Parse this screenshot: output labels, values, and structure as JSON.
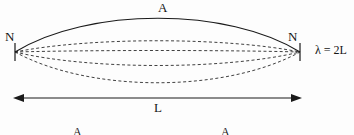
{
  "figure": {
    "width": 354,
    "height": 135,
    "background_color": "#fdfdfd",
    "ink_color": "#1a1a1a"
  },
  "labels": {
    "antinode_top": "A",
    "node_left": "N",
    "node_right": "N",
    "wavelength_relation": "λ = 2L",
    "length": "L",
    "antinode_bottom_left": "A",
    "antinode_bottom_right": "A"
  },
  "diagram_data": {
    "type": "standing-wave",
    "mode": "fundamental",
    "harmonic_number": 1,
    "node_count": 2,
    "antinode_count": 1,
    "endpoints": {
      "left": {
        "x": 15,
        "y": 52
      },
      "right": {
        "x": 300,
        "y": 52
      }
    },
    "string_length_px": 285,
    "envelope_solid": {
      "style": "solid",
      "stroke_width": 1.1,
      "amplitude_px": -34,
      "description": "upper envelope of the vibrating string at maximum displacement"
    },
    "intermediate_curves": [
      {
        "style": "dashed",
        "amplitude_px": -15,
        "stroke_width": 0.9
      },
      {
        "style": "dashed",
        "amplitude_px": -2,
        "stroke_width": 0.9
      },
      {
        "style": "dashed",
        "amplitude_px": 13,
        "stroke_width": 0.9
      },
      {
        "style": "dashed",
        "amplitude_px": 30,
        "stroke_width": 0.9
      }
    ],
    "dash_pattern": "3,2.4",
    "node_ticks": {
      "style": "vertical-tick",
      "half_height_px": 9
    },
    "dimension_arrow": {
      "label": "L",
      "y": 98,
      "x_start": 15,
      "x_end": 300,
      "heads": "both",
      "stroke_width": 1.1
    }
  }
}
